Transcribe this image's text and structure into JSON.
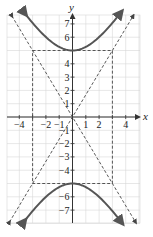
{
  "chart_data": {
    "type": "line",
    "title": "",
    "xlabel": "x",
    "ylabel": "y",
    "equation": "y^2/25 - x^2/9 = 1",
    "xlim": [
      -5,
      5
    ],
    "ylim": [
      -8,
      7.7
    ],
    "grid": true,
    "x_ticks": [
      -4,
      -2,
      -1,
      1,
      2,
      4
    ],
    "y_ticks": [
      7,
      6,
      4,
      3,
      2,
      1,
      -1,
      -2,
      -3,
      -4,
      -6,
      -7
    ],
    "series": [
      {
        "name": "hyperbola-upper-branch",
        "style": "solid",
        "x": [
          -3.6,
          -3,
          -2,
          -1,
          0,
          1,
          2,
          3,
          3.6
        ],
        "y": [
          7.81,
          7.07,
          6.01,
          5.27,
          5,
          5.27,
          6.01,
          7.07,
          7.81
        ]
      },
      {
        "name": "hyperbola-lower-branch",
        "style": "solid",
        "x": [
          -3.6,
          -3,
          -2,
          -1,
          0,
          1,
          2,
          3,
          3.6
        ],
        "y": [
          -7.81,
          -7.07,
          -6.01,
          -5.27,
          -5,
          -5.27,
          -6.01,
          -7.07,
          -7.81
        ]
      },
      {
        "name": "asymptote-positive",
        "style": "dashed",
        "equation": "y = (5/3)x",
        "x": [
          -4.8,
          4.8
        ],
        "y": [
          -8,
          8
        ]
      },
      {
        "name": "asymptote-negative",
        "style": "dashed",
        "equation": "y = -(5/3)x",
        "x": [
          -4.8,
          4.8
        ],
        "y": [
          8,
          -8
        ]
      },
      {
        "name": "fundamental-rectangle",
        "style": "dashed",
        "x": [
          -3,
          3,
          3,
          -3,
          -3
        ],
        "y": [
          5,
          5,
          -5,
          -5,
          5
        ]
      }
    ],
    "colors": {
      "curve": "#555555",
      "dashed": "#444444",
      "grid": "#d6d6d6",
      "axis": "#333333"
    }
  },
  "labels": {
    "x_axis": "x",
    "y_axis": "y",
    "x_ticks": [
      "−4",
      "−2",
      "−1",
      "1",
      "2",
      "4"
    ],
    "y_ticks": [
      "7",
      "6",
      "4",
      "3",
      "2",
      "1",
      "−1",
      "−2",
      "−3",
      "−4",
      "−6",
      "−7"
    ]
  }
}
